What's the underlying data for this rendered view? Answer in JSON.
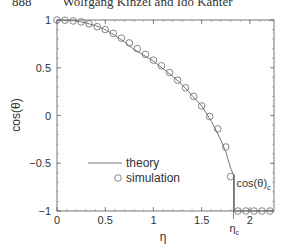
{
  "header": {
    "page_number": "888",
    "authors": "Wolfgang Kinzel and Ido Kanter"
  },
  "chart_data": {
    "type": "line",
    "title": "",
    "xlabel": "η",
    "ylabel": "cos(θ)",
    "xlim": [
      0,
      2.25
    ],
    "ylim": [
      -1,
      1
    ],
    "xticks": [
      0,
      0.5,
      1,
      1.5,
      2
    ],
    "xtick_labels": [
      "0",
      "0.5",
      "1",
      "1.5",
      "2"
    ],
    "yticks": [
      -1,
      -0.5,
      0,
      0.5,
      1
    ],
    "ytick_labels": [
      "−1",
      "−0.5",
      "0",
      "0.5",
      "1"
    ],
    "grid": false,
    "legend_position": "lower-center",
    "annotations": [
      {
        "text": "η_c",
        "x": 1.83,
        "y": -1,
        "note": "critical eta marked below x-axis"
      },
      {
        "text": "cos(θ)_c",
        "x": 1.9,
        "y": -0.72,
        "note": "bracket on right marking the jump from cos(θ)_c to -1"
      }
    ],
    "eta_c": 1.83,
    "cos_theta_c": -0.62,
    "series": [
      {
        "name": "theory",
        "style": "line",
        "x": [
          0,
          0.1,
          0.2,
          0.3,
          0.4,
          0.5,
          0.6,
          0.7,
          0.8,
          0.9,
          1.0,
          1.1,
          1.2,
          1.3,
          1.4,
          1.5,
          1.6,
          1.7,
          1.75,
          1.8,
          1.83,
          1.83,
          2.25
        ],
        "y": [
          1,
          0.997,
          0.99,
          0.97,
          0.94,
          0.9,
          0.84,
          0.77,
          0.69,
          0.63,
          0.57,
          0.49,
          0.41,
          0.32,
          0.21,
          0.1,
          -0.06,
          -0.26,
          -0.38,
          -0.55,
          -0.62,
          -1,
          -1
        ]
      },
      {
        "name": "simulation",
        "style": "open-circle",
        "x": [
          0,
          0.083,
          0.167,
          0.25,
          0.333,
          0.417,
          0.5,
          0.583,
          0.667,
          0.75,
          0.833,
          0.917,
          1.0,
          1.083,
          1.167,
          1.25,
          1.333,
          1.417,
          1.5,
          1.583,
          1.667,
          1.75,
          1.8,
          1.875,
          1.958,
          2.042,
          2.125,
          2.208
        ],
        "y": [
          1,
          0.998,
          0.99,
          0.98,
          0.96,
          0.93,
          0.9,
          0.86,
          0.81,
          0.76,
          0.7,
          0.64,
          0.58,
          0.52,
          0.45,
          0.37,
          0.29,
          0.2,
          0.1,
          -0.01,
          -0.14,
          -0.33,
          -0.64,
          -1,
          -1,
          -1,
          -1,
          -1
        ]
      }
    ],
    "legend": [
      {
        "label": "theory",
        "marker": "line"
      },
      {
        "label": "simulation",
        "marker": "open-circle"
      }
    ]
  }
}
